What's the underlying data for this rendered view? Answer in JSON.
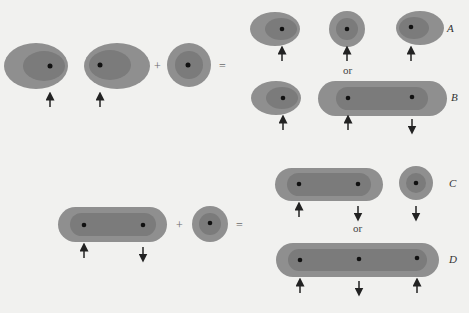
{
  "colors": {
    "background": "#f1f1ef",
    "outer_shell": "#8e8e8e",
    "inner_core": "#7a7a7a",
    "nucleus": "#111111",
    "arrow": "#222222"
  },
  "operators": {
    "plus": "+",
    "equals": "=",
    "or": "or"
  },
  "labels": {
    "A": "A",
    "B": "B",
    "C": "C",
    "D": "D"
  },
  "diagram": {
    "top_reaction": {
      "reactants": [
        {
          "shape": "ellipse",
          "spin": "up"
        },
        {
          "shape": "ellipse",
          "spin": "up"
        },
        {
          "shape": "circle",
          "spin": "none"
        }
      ],
      "outcomes": [
        {
          "label": "A",
          "products": [
            {
              "shape": "ellipse",
              "spin": "up"
            },
            {
              "shape": "circle",
              "spin": "up"
            },
            {
              "shape": "ellipse",
              "spin": "up"
            }
          ]
        },
        {
          "label": "B",
          "products": [
            {
              "shape": "ellipse",
              "spin": "up"
            },
            {
              "shape": "capsule",
              "nuclei": 2,
              "spins": [
                "up",
                "down"
              ]
            }
          ]
        }
      ]
    },
    "bottom_reaction": {
      "reactants": [
        {
          "shape": "capsule",
          "nuclei": 2,
          "spins": [
            "up",
            "down"
          ]
        },
        {
          "shape": "circle",
          "spin": "none"
        }
      ],
      "outcomes": [
        {
          "label": "C",
          "products": [
            {
              "shape": "capsule",
              "nuclei": 2,
              "spins": [
                "up",
                "down"
              ]
            },
            {
              "shape": "circle",
              "spin": "down"
            }
          ]
        },
        {
          "label": "D",
          "products": [
            {
              "shape": "capsule",
              "nuclei": 3,
              "spins": [
                "up",
                "down",
                "up"
              ]
            }
          ]
        }
      ]
    }
  }
}
